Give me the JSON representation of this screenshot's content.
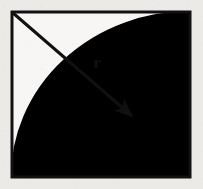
{
  "figure": {
    "background_color": "#eceae7",
    "interior_color": "#f7f6f4",
    "ink_color": "#111111",
    "shaded_region_color": "#000000",
    "square": {
      "name": "square-outline",
      "x": 12,
      "y": 12,
      "width": 178,
      "height": 165,
      "stroke_width": 3
    },
    "arc": {
      "name": "quarter-circle-arc",
      "center_x": 12,
      "center_y": 177,
      "radius_x": 178,
      "radius_y": 165,
      "start_point": "top-right-corner",
      "end_point": "bottom-left-tangent",
      "stroke_width": 2
    },
    "shaded_region": {
      "name": "region-outside-arc",
      "description": "bottom-right lune between the arc and the square corner",
      "fill": "#000000"
    },
    "radius_arrow": {
      "name": "radius-arrow",
      "from_x": 13,
      "from_y": 13,
      "to_x": 134,
      "to_y": 118,
      "stroke_width": 3,
      "head_length": 13,
      "head_width": 8
    },
    "labels": {
      "radius": "r",
      "radius_x": 97,
      "radius_y": 68,
      "radius_font_size": 17
    }
  }
}
